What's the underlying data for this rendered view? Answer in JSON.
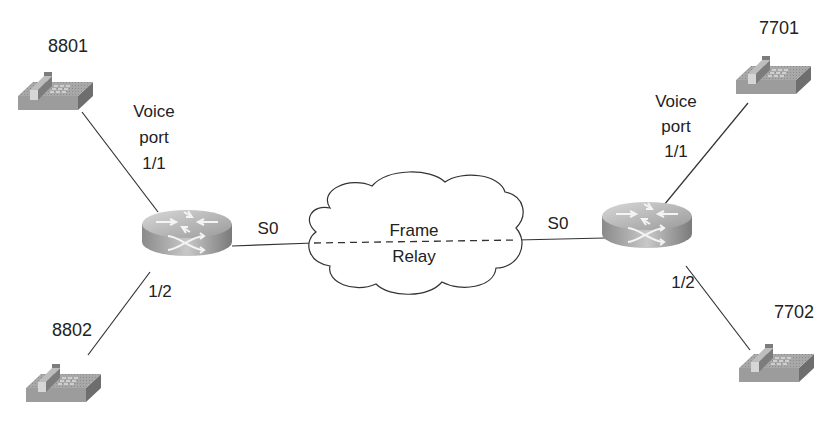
{
  "diagram": {
    "type": "network-topology",
    "colors": {
      "line": "#333333",
      "device": "#9a9a9a",
      "text": "#222222"
    },
    "phones": [
      {
        "id": "phone-8801",
        "label": "8801"
      },
      {
        "id": "phone-8802",
        "label": "8802"
      },
      {
        "id": "phone-7701",
        "label": "7701"
      },
      {
        "id": "phone-7702",
        "label": "7702"
      }
    ],
    "routers": [
      {
        "id": "router-left"
      },
      {
        "id": "router-right"
      }
    ],
    "cloud": {
      "line1": "Frame",
      "line2": "Relay"
    },
    "labels": {
      "left_voice_port_line1": "Voice",
      "left_voice_port_line2": "port",
      "left_voice_port_line3": "1/1",
      "left_port_12": "1/2",
      "left_s0": "S0",
      "right_voice_port_line1": "Voice",
      "right_voice_port_line2": "port",
      "right_voice_port_line3": "1/1",
      "right_port_12": "1/2",
      "right_s0": "S0"
    }
  }
}
